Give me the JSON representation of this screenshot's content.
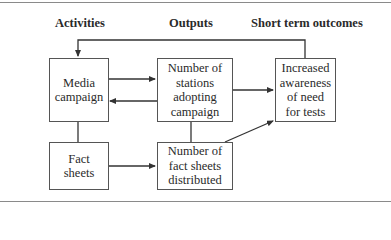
{
  "headers": {
    "activities": "Activities",
    "outputs": "Outputs",
    "outcomes": "Short term outcomes"
  },
  "boxes": {
    "media": [
      "Media",
      "campaign"
    ],
    "fact": [
      "Fact",
      "sheets"
    ],
    "stations": [
      "Number of",
      "stations",
      "adopting",
      "campaign"
    ],
    "distributed": [
      "Number of",
      "fact sheets",
      "distributed"
    ],
    "awareness": [
      "Increased",
      "awareness",
      "of need",
      "for tests"
    ]
  },
  "colors": {
    "line": "#333333",
    "border": "#555555",
    "rule": "#8a8a8a"
  }
}
